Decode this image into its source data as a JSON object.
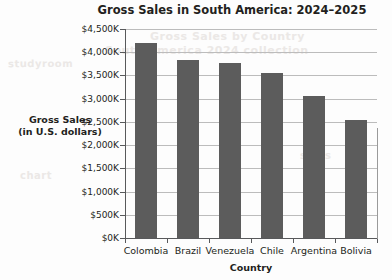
{
  "chart_data": {
    "type": "bar",
    "title": "Gross Sales in South America: 2024–2025",
    "xlabel": "Country",
    "ylabel_line1": "Gross Sales",
    "ylabel_line2": "(in U.S. dollars)",
    "ylabel": "Gross Sales (in U.S. dollars)",
    "categories": [
      "Colombia",
      "Brazil",
      "Venezuela",
      "Chile",
      "Argentina",
      "Bolivia"
    ],
    "values": [
      4200,
      3830,
      3760,
      3550,
      3050,
      2550
    ],
    "value_unit": "thousands of U.S. dollars",
    "ylim": [
      0,
      4500
    ],
    "ytick_values": [
      0,
      500,
      1000,
      1500,
      2000,
      2500,
      3000,
      3500,
      4000,
      4500
    ],
    "ytick_labels": [
      "$0K",
      "$500K",
      "$1,000K",
      "$1,500K",
      "$2,000K",
      "$2,500K",
      "$3,000K",
      "$3,500K",
      "$4,000K",
      "$4,500K"
    ],
    "grid": true,
    "legend": false,
    "bar_color": "#5c5c5c",
    "grid_color": "#bcbcbc",
    "axis_color": "#58595b",
    "text_color": "#231f20",
    "background_color": "#fdfdfd"
  },
  "watermark": {
    "lines": [
      "studyroom",
      "Gross Sales by Country",
      "South America 2024 collection",
      "chart",
      "sales"
    ]
  }
}
